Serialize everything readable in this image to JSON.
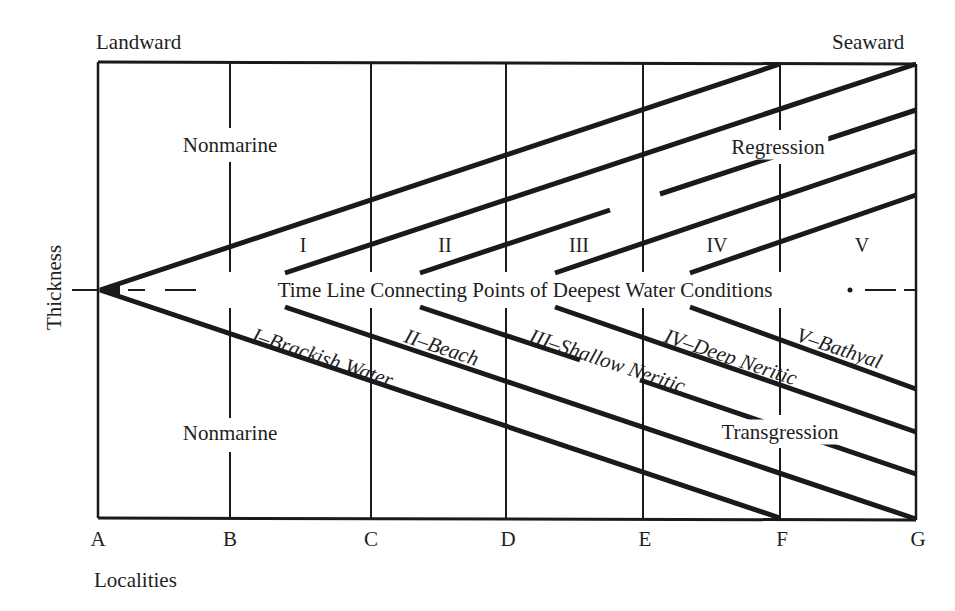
{
  "diagram": {
    "title_edges": {
      "left": "Landward",
      "right": "Seaward"
    },
    "y_axis_label": "Thickness",
    "x_axis_label": "Localities",
    "localities": [
      "A",
      "B",
      "C",
      "D",
      "E",
      "F",
      "G"
    ],
    "regions": {
      "upper_nonmarine": "Nonmarine",
      "lower_nonmarine": "Nonmarine",
      "regression": "Regression",
      "transgression": "Transgression"
    },
    "zones_upper": [
      "I",
      "II",
      "III",
      "IV",
      "V"
    ],
    "facies_lower": [
      "I–Brackish Water",
      "II–Beach",
      "III–Shallow Neritic",
      "IV–Deep Neritic",
      "V–Bathyal"
    ],
    "time_line": "Time Line Connecting Points of Deepest Water Conditions",
    "colors": {
      "ink": "#1a1a1a",
      "background": "#ffffff"
    }
  }
}
